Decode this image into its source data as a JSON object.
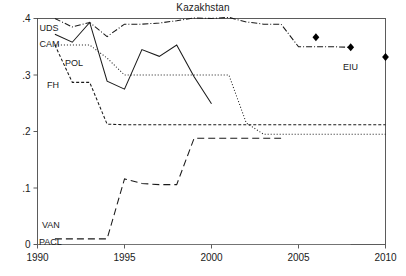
{
  "chart_data": {
    "type": "line",
    "title": "Kazakhstan",
    "xlabel": "",
    "ylabel": "",
    "xlim": [
      1990,
      2010
    ],
    "ylim": [
      0,
      0.4
    ],
    "grid": false,
    "legend": "inline-labels",
    "x_ticks": [
      "1990",
      "1995",
      "2000",
      "2005",
      "2010"
    ],
    "x_tick_values": [
      1990,
      1995,
      2000,
      2005,
      2010
    ],
    "y_ticks": [
      "0",
      ".1",
      ".2",
      ".3",
      ".4"
    ],
    "y_tick_values": [
      0,
      0.1,
      0.2,
      0.3,
      0.4
    ],
    "series": [
      {
        "name": "UDS",
        "label": "UDS",
        "style": "dash-dot",
        "x": [
          1991,
          1992,
          1993,
          1994,
          1995,
          1996,
          1997,
          1998,
          1999,
          2000,
          2001,
          2002,
          2003,
          2004,
          2005,
          2006,
          2007,
          2008
        ],
        "values": [
          0.4,
          0.385,
          0.393,
          0.368,
          0.39,
          0.39,
          0.392,
          0.396,
          0.401,
          0.4,
          0.402,
          0.394,
          0.39,
          0.39,
          0.35,
          0.35,
          0.35,
          0.349
        ]
      },
      {
        "name": "CAM",
        "label": "CAM",
        "style": "solid",
        "x": [
          1991,
          1992,
          1993,
          1994,
          1995,
          1996,
          1997,
          1998,
          1999,
          2000
        ],
        "values": [
          0.372,
          0.358,
          0.393,
          0.289,
          0.275,
          0.345,
          0.333,
          0.353,
          0.297,
          0.249
        ]
      },
      {
        "name": "POL",
        "label": "POL",
        "style": "dotted",
        "x": [
          1991,
          1992,
          1993,
          1994,
          1995,
          1996,
          1997,
          1998,
          1999,
          2000,
          2001,
          2002,
          2003,
          2004,
          2005,
          2006,
          2007,
          2008,
          2009,
          2010
        ],
        "values": [
          0.353,
          0.353,
          0.353,
          0.33,
          0.3,
          0.3,
          0.3,
          0.3,
          0.3,
          0.3,
          0.3,
          0.215,
          0.195,
          0.195,
          0.195,
          0.195,
          0.195,
          0.195,
          0.195,
          0.195
        ]
      },
      {
        "name": "FH",
        "label": "FH",
        "style": "dashed-short",
        "x": [
          1991,
          1992,
          1993,
          1994,
          1995,
          1996,
          1997,
          1998,
          1999,
          2000,
          2001,
          2002,
          2003,
          2004,
          2005,
          2006,
          2007,
          2008,
          2009,
          2010
        ],
        "values": [
          0.353,
          0.287,
          0.287,
          0.213,
          0.212,
          0.212,
          0.212,
          0.212,
          0.212,
          0.212,
          0.212,
          0.212,
          0.212,
          0.212,
          0.212,
          0.212,
          0.212,
          0.212,
          0.212,
          0.212
        ]
      },
      {
        "name": "VAN",
        "label": "VAN",
        "style": "dashed-long",
        "x": [
          1991,
          1992,
          1993,
          1994,
          1995,
          1996,
          1997,
          1998,
          1999,
          2000,
          2001,
          2002,
          2003,
          2004
        ],
        "values": [
          0.01,
          0.01,
          0.01,
          0.01,
          0.116,
          0.108,
          0.106,
          0.106,
          0.188,
          0.188,
          0.188,
          0.188,
          0.188,
          0.188
        ]
      },
      {
        "name": "PACL",
        "label": "PACL",
        "style": "solid-thin",
        "x": [
          1990,
          1995,
          2000,
          2005,
          2008
        ],
        "values": [
          0.0,
          0.0,
          0.0,
          0.0,
          0.0
        ]
      },
      {
        "name": "EIU",
        "label": "EIU",
        "style": "markers-diamond",
        "x": [
          2006,
          2008,
          2010
        ],
        "values": [
          0.367,
          0.349,
          0.332
        ]
      }
    ]
  }
}
